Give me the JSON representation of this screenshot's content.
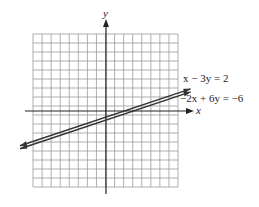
{
  "figure": {
    "type": "coordinate-graph",
    "grid": {
      "columns": 16,
      "rows": 17,
      "left": 33,
      "top": 34,
      "right": 178,
      "bottom": 187
    },
    "origin_px": {
      "x": 106,
      "y": 111
    },
    "unit_px": 9.1,
    "colors": {
      "grid": "#9a9a9a",
      "axis": "#222222",
      "line": "#333333",
      "background": "#ffffff"
    }
  },
  "axes": {
    "x_label": "x",
    "y_label": "y"
  },
  "lines": [
    {
      "equation": "x − 3y = 2",
      "slope": 0.3333,
      "y_intercept": -0.6667
    },
    {
      "equation": "−2x + 6y = −6",
      "slope": 0.3333,
      "y_intercept": -1
    }
  ],
  "labels": {
    "line1": "x − 3y = 2",
    "line2": "−2x + 6y = −6"
  }
}
